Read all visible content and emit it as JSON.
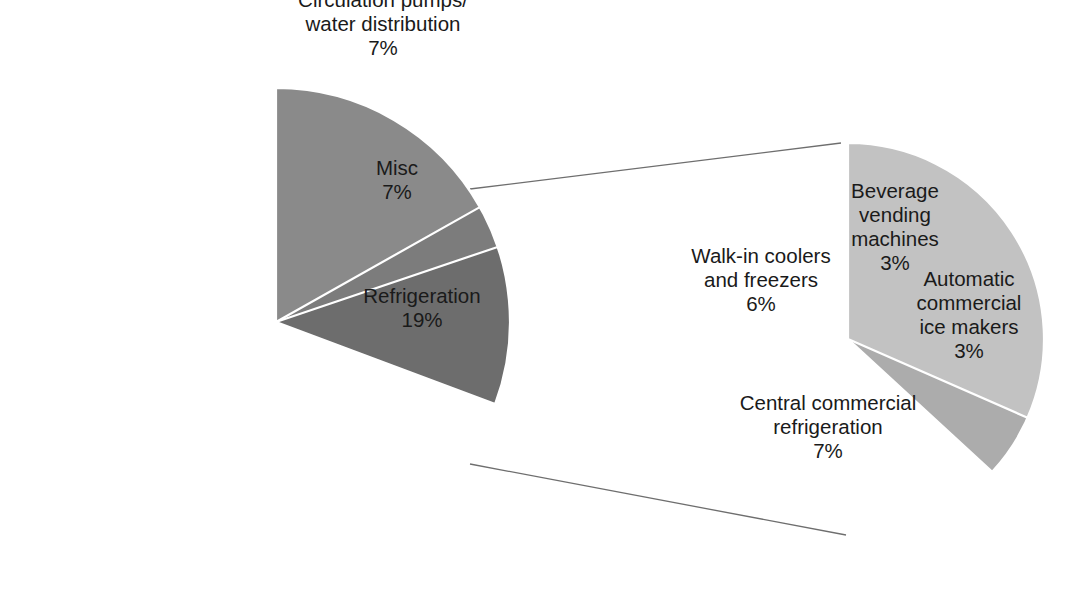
{
  "figure": {
    "background_color": "#ffffff",
    "width": 1074,
    "height": 594
  },
  "chart_data": [
    {
      "type": "pie",
      "name": "commercial-building-energy-end-uses",
      "title": "",
      "subtitle": "",
      "xlabel": "",
      "ylabel": "",
      "legend_position": "none",
      "grid": false,
      "center": [
        276,
        322
      ],
      "radius": 234,
      "start_angle_deg": 0,
      "direction": "clockwise",
      "total_percent": 101,
      "categories": [
        "Circulation pumps/ water distribution",
        "Misc",
        "Refrigeration",
        "Commercial air conditioners",
        "Air distribution",
        "Chiller compressors"
      ],
      "values": [
        7,
        7,
        19,
        31,
        20,
        17
      ],
      "value_labels": [
        "7%",
        "7%",
        "19%",
        "31%",
        "20%",
        "17%"
      ],
      "slices": [
        {
          "label_line1": "Circulation pumps/",
          "label_line2": "water distribution",
          "label_line3": "",
          "value_label": "7%",
          "value": 7,
          "color": "#868686",
          "label_placement": "outside",
          "text_color": "#1a1a1a",
          "label_x": 383,
          "label_y": 26
        },
        {
          "label_line1": "Misc",
          "label_line2": "",
          "label_line3": "",
          "value_label": "7%",
          "value": 7,
          "color": "#8c8c8c",
          "label_placement": "inside",
          "text_color": "#1a1a1a",
          "label_x": 397,
          "label_y": 182
        },
        {
          "label_line1": "Refrigeration",
          "label_line2": "",
          "label_line3": "",
          "value_label": "19%",
          "value": 19,
          "color": "#e2e2e2",
          "label_placement": "inside",
          "text_color": "#1a1a1a",
          "label_x": 422,
          "label_y": 310
        },
        {
          "label_line1": "Commercial air",
          "label_line2": "conditioners",
          "label_line3": "",
          "value_label": "31%",
          "value": 31,
          "color": "#6d6d6d",
          "label_placement": "inside",
          "text_color": "#ffffff",
          "label_x": 282,
          "label_y": 433
        },
        {
          "label_line1": "Air distribution",
          "label_line2": "",
          "label_line3": "",
          "value_label": "20%",
          "value": 20,
          "color": "#7c7c7c",
          "label_placement": "inside",
          "text_color": "#ffffff",
          "label_x": 134,
          "label_y": 311
        },
        {
          "label_line1": "Chiller",
          "label_line2": "compressors",
          "label_line3": "",
          "value_label": "17%",
          "value": 17,
          "color": "#8a8a8a",
          "label_placement": "inside",
          "text_color": "#ffffff",
          "label_x": 195,
          "label_y": 142
        }
      ]
    },
    {
      "type": "pie",
      "name": "refrigeration-breakdown",
      "title": "",
      "subtitle": "",
      "xlabel": "",
      "ylabel": "",
      "legend_position": "none",
      "grid": false,
      "center": [
        848,
        339
      ],
      "radius": 196,
      "start_angle_deg": 0,
      "direction": "clockwise",
      "total_percent": 19,
      "categories": [
        "Beverage vending machines",
        "Automatic commercial ice makers",
        "Central commercial refrigeration",
        "Walk-in coolers and freezers"
      ],
      "values": [
        3,
        3,
        7,
        6
      ],
      "value_labels": [
        "3%",
        "3%",
        "7%",
        "6%"
      ],
      "slices": [
        {
          "label_line1": "Beverage",
          "label_line2": "vending",
          "label_line3": "machines",
          "value_label": "3%",
          "value": 3,
          "color": "#c9c9c9",
          "label_placement": "inside",
          "text_color": "#1a1a1a",
          "label_x": 895,
          "label_y": 229
        },
        {
          "label_line1": "Automatic",
          "label_line2": "commercial",
          "label_line3": "ice makers",
          "value_label": "3%",
          "value": 3,
          "color": "#e8e8e8",
          "label_placement": "inside",
          "text_color": "#1a1a1a",
          "label_x": 969,
          "label_y": 317
        },
        {
          "label_line1": "Central commercial",
          "label_line2": "refrigeration",
          "label_line3": "",
          "value_label": "7%",
          "value": 7,
          "color": "#acacac",
          "label_placement": "inside",
          "text_color": "#1a1a1a",
          "label_x": 828,
          "label_y": 429
        },
        {
          "label_line1": "Walk-in coolers",
          "label_line2": "and freezers",
          "label_line3": "",
          "value_label": "6%",
          "value": 6,
          "color": "#c2c2c2",
          "label_placement": "inside",
          "text_color": "#1a1a1a",
          "label_x": 761,
          "label_y": 282
        }
      ]
    }
  ],
  "connectors": {
    "color": "#6e6e6e",
    "upper": {
      "x1": 470,
      "y1": 189,
      "x2": 841,
      "y2": 143
    },
    "lower": {
      "x1": 470,
      "y1": 464,
      "x2": 846,
      "y2": 535
    }
  }
}
